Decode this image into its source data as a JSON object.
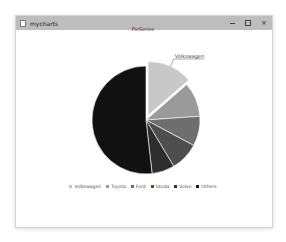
{
  "window": {
    "title": "mycharts",
    "controls": {
      "minimize_icon": "minimize-icon",
      "maximize_icon": "maximize-icon",
      "close_icon": "close-icon",
      "close_glyph": "×"
    }
  },
  "chart_data": {
    "type": "pie",
    "title": "PieSeries",
    "categories": [
      "Volkswagen",
      "Toyota",
      "Ford",
      "Skoda",
      "Volvo",
      "Others"
    ],
    "values": [
      13.6,
      10.3,
      8.9,
      8.6,
      6.8,
      51.8
    ],
    "colors": [
      "#c8c8c8",
      "#9a9a9a",
      "#6e6e6e",
      "#4e4e4e",
      "#2e2e2e",
      "#111111"
    ],
    "exploded": [
      "Volkswagen"
    ],
    "labels_visible": [
      "Volkswagen"
    ],
    "legend_position": "bottom",
    "start_angle_deg": 0,
    "direction": "clockwise"
  },
  "legend": {
    "items": [
      {
        "label": "Volkswagen",
        "color": "#c8c8c8"
      },
      {
        "label": "Toyota",
        "color": "#9a9a9a"
      },
      {
        "label": "Ford",
        "color": "#6e6e6e"
      },
      {
        "label": "Skoda",
        "color": "#4e4e4e"
      },
      {
        "label": "Volvo",
        "color": "#2e2e2e"
      },
      {
        "label": "Others",
        "color": "#111111"
      }
    ]
  }
}
